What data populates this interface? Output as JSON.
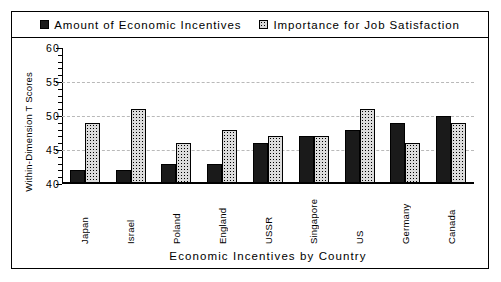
{
  "chart_data": {
    "type": "bar",
    "title": "",
    "xlabel": "Economic Incentives by Country",
    "ylabel": "Within-Dimension T Scores",
    "categories": [
      "Japan",
      "Israel",
      "Poland",
      "England",
      "USSR",
      "Singapore",
      "US",
      "Germany",
      "Canada"
    ],
    "series": [
      {
        "name": "Amount of Economic Incentives",
        "marker": "solid-black-square",
        "values": [
          42,
          42,
          43,
          43,
          46,
          47,
          48,
          49,
          50
        ]
      },
      {
        "name": "Importance for Job Satisfaction",
        "marker": "dotted-square",
        "values": [
          49,
          51,
          46,
          48,
          47,
          47,
          51,
          46,
          49
        ]
      }
    ],
    "ylim": [
      40,
      60
    ],
    "yticks": [
      40,
      45,
      50,
      55,
      60
    ],
    "ytick_labels": [
      "40",
      "45",
      "50",
      "55",
      "60"
    ],
    "grid": "horizontal-dashed",
    "minor_ticks": true,
    "legend_position": "top"
  },
  "legend": {
    "items": [
      {
        "label": "Amount of Economic Incentives",
        "swatch": "solid"
      },
      {
        "label": "Importance for Job Satisfaction",
        "swatch": "dot"
      }
    ]
  },
  "colors": {
    "series_1": "#1a1a1a",
    "series_2": "#dcdcdc",
    "axis": "#000000",
    "grid": "#b9b9b9",
    "background": "#ffffff"
  }
}
